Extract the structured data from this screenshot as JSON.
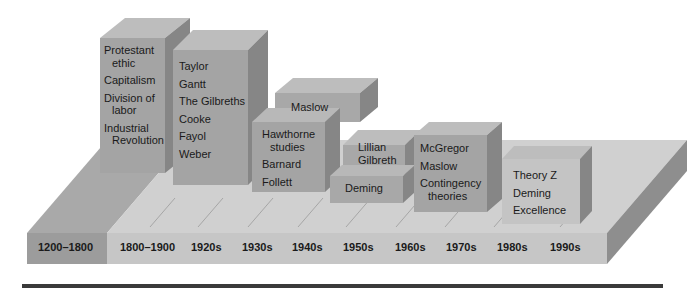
{
  "diagram": {
    "type": "timeline-3d-blocks",
    "colors": {
      "background": "#ffffff",
      "slab_top": "#cfcfcf",
      "slab_top_left": "#a9a9a9",
      "slab_front": "#c4c4c4",
      "slab_front_left": "#9a9a9a",
      "slab_side": "#8c8c8c",
      "block_front": "#a3a3a3",
      "block_top": "#bcbcbc",
      "block_side": "#888888",
      "rule": "#3a3a3a",
      "text": "#1a1a1a"
    },
    "eras": [
      {
        "label": "1200–1800"
      },
      {
        "label": "1800–1900"
      },
      {
        "label": "1920s"
      },
      {
        "label": "1930s"
      },
      {
        "label": "1940s"
      },
      {
        "label": "1950s"
      },
      {
        "label": "1960s"
      },
      {
        "label": "1970s"
      },
      {
        "label": "1980s"
      },
      {
        "label": "1990s"
      }
    ],
    "blocks": [
      {
        "id": "pre-industrial",
        "items": [
          "Protestant ethic",
          "Capitalism",
          "Division of labor",
          "Industrial Revolution"
        ]
      },
      {
        "id": "classical",
        "items": [
          "Taylor",
          "Gantt",
          "The Gilbreths",
          "Cooke",
          "Fayol",
          "Weber"
        ]
      },
      {
        "id": "1940s-top",
        "items": [
          "Maslow"
        ]
      },
      {
        "id": "human-relations",
        "items": [
          "Hawthorne studies",
          "Barnard",
          "Follett"
        ]
      },
      {
        "id": "1950s-top",
        "items": [
          "Lillian Gilbreth"
        ]
      },
      {
        "id": "1950s-bottom",
        "items": [
          "Deming"
        ]
      },
      {
        "id": "1970s",
        "items": [
          "McGregor",
          "Maslow",
          "Contingency theories"
        ]
      },
      {
        "id": "1980s",
        "items": [
          "Theory Z",
          "Deming",
          "Excellence"
        ]
      }
    ],
    "text": {
      "b1_l1": "Protestant",
      "b1_l1b": "ethic",
      "b1_l2": "Capitalism",
      "b1_l3": "Division of",
      "b1_l3b": "labor",
      "b1_l4": "Industrial",
      "b1_l4b": "Revolution",
      "b2_l1": "Taylor",
      "b2_l2": "Gantt",
      "b2_l3": "The Gilbreths",
      "b2_l4": "Cooke",
      "b2_l5": "Fayol",
      "b2_l6": "Weber",
      "b3_l1": "Maslow",
      "b4_l1": "Hawthorne",
      "b4_l1b": "studies",
      "b4_l2": "Barnard",
      "b4_l3": "Follett",
      "b5_l1": "Lillian",
      "b5_l1b": "Gilbreth",
      "b6_l1": "Deming",
      "b7_l1": "McGregor",
      "b7_l2": "Maslow",
      "b7_l3": "Contingency",
      "b7_l3b": "theories",
      "b8_l1": "Theory Z",
      "b8_l2": "Deming",
      "b8_l3": "Excellence"
    }
  }
}
